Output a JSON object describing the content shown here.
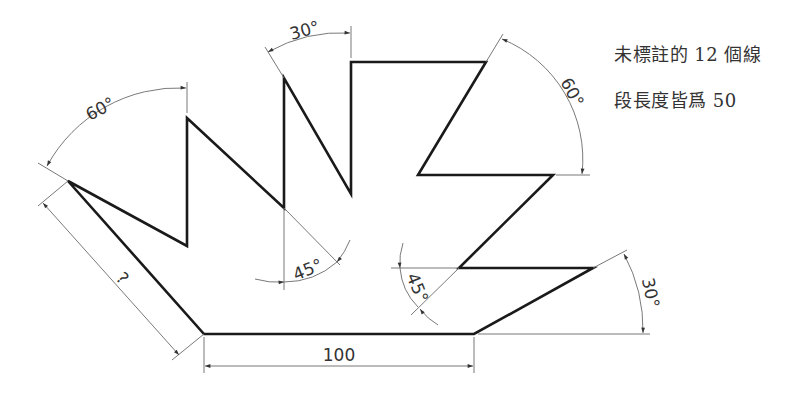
{
  "note": {
    "line1": "未標註的 12 個線",
    "line2": "段長度皆爲 50"
  },
  "dimensions": {
    "unknown_length": "?",
    "base_length": "100",
    "angle_top_left": "60°",
    "angle_top_middle": "30°",
    "angle_top_right": "60°",
    "angle_center_left": "45°",
    "angle_center_right": "45°",
    "angle_bottom_right": "30°"
  },
  "colors": {
    "outline": "#1a1a1a",
    "dimension_line": "#6a6a6a",
    "text": "#333333"
  }
}
